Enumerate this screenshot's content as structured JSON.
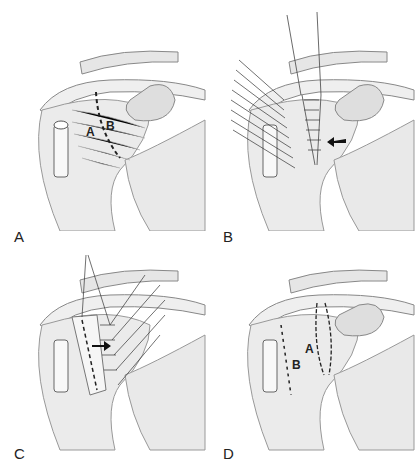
{
  "figure": {
    "panels": [
      {
        "id": "A",
        "label": "A",
        "inner_labels": [
          "A",
          "B"
        ]
      },
      {
        "id": "B",
        "label": "B",
        "inner_labels": []
      },
      {
        "id": "C",
        "label": "C",
        "inner_labels": []
      },
      {
        "id": "D",
        "label": "D",
        "inner_labels": [
          "A",
          "B"
        ]
      }
    ],
    "colors": {
      "bone": "#ececec",
      "shadow": "#bdbdbd",
      "line": "#333333",
      "capsule": "#f4f4f4"
    }
  }
}
